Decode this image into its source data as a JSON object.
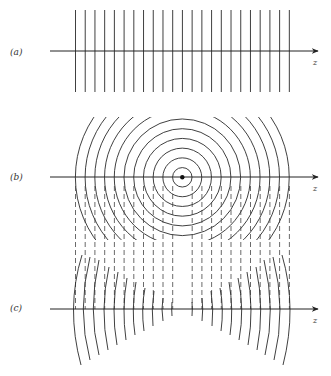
{
  "figure": {
    "width": 331,
    "height": 376,
    "ink_color": "#2a2a2a",
    "background": "#ffffff",
    "panels": [
      {
        "id": "a",
        "label": "(a)",
        "label_pos": [
          10,
          55
        ],
        "axis": {
          "y": 51,
          "x_start": 50,
          "x_end": 318,
          "label": "z",
          "label_pos": [
            313,
            65
          ]
        },
        "description": "plane wavefronts",
        "plane_wavefronts": {
          "x_start": 75.5,
          "spacing": 9.72,
          "count": 23,
          "y_top": 10,
          "y_bottom": 92
        }
      },
      {
        "id": "b",
        "label": "(b)",
        "label_pos": [
          10,
          180
        ],
        "axis": {
          "y": 177,
          "x_start": 50,
          "x_end": 318,
          "label": "z",
          "label_pos": [
            313,
            191
          ]
        },
        "description": "spherical wavefronts from point source",
        "point_source": {
          "cx": 182.3,
          "cy": 177.3,
          "r": 2.2
        },
        "spherical_wavefronts": {
          "radius_step": 9.72,
          "count": 11,
          "clip": {
            "x": 72,
            "y": 117,
            "w": 220,
            "h": 123
          }
        }
      },
      {
        "id": "c",
        "label": "(c)",
        "label_pos": [
          10,
          311
        ],
        "axis": {
          "y": 309,
          "x_start": 50,
          "x_end": 318,
          "label": "z",
          "label_pos": [
            313,
            323
          ]
        },
        "description": "superposition: dashed plane waves with curved wavefront segments",
        "dashed_lines": {
          "x_positions": [
            75.5,
            85.2,
            94.9,
            104.7,
            114.4,
            124.1,
            133.8,
            143.5,
            153.3,
            163.0,
            172.7,
            192.2,
            201.9,
            211.6,
            221.3,
            231.0,
            240.8,
            250.5,
            260.2,
            269.9,
            279.6,
            289.4
          ],
          "y_top": 186,
          "y_bottom": 309
        },
        "curved_segments_left": [
          {
            "axis_x": 73.5,
            "top": [
              82,
              255
            ],
            "bottom": [
              81,
              365
            ]
          },
          {
            "axis_x": 83.3,
            "top": [
              90,
              257
            ],
            "bottom": [
              90,
              360
            ]
          },
          {
            "axis_x": 93.3,
            "top": [
              99,
              260
            ],
            "bottom": [
              99,
              355
            ]
          },
          {
            "axis_x": 104.0,
            "top": [
              109,
              267
            ],
            "bottom": [
              108,
              350
            ]
          },
          {
            "axis_x": 114.0,
            "top": [
              118,
              272
            ],
            "bottom": [
              117,
              345
            ]
          },
          {
            "axis_x": 124.0,
            "top": [
              127,
              278
            ],
            "bottom": [
              126,
              340
            ]
          },
          {
            "axis_x": 133.3,
            "top": [
              136,
              282
            ],
            "bottom": [
              135,
              335
            ]
          },
          {
            "axis_x": 142.7,
            "top": [
              145,
              288
            ],
            "bottom": [
              144,
              331
            ]
          },
          {
            "axis_x": 152.3,
            "top": [
              154,
              291
            ],
            "bottom": [
              153,
              326
            ]
          },
          {
            "axis_x": 162.0,
            "top": [
              163,
              298
            ],
            "bottom": [
              163,
              321
            ]
          },
          {
            "axis_x": 171.7,
            "top": [
              172,
              302
            ],
            "bottom": [
              172,
              316
            ]
          }
        ],
        "curved_segments_right": [
          {
            "axis_x": 192.3,
            "top": [
              192,
              302
            ],
            "bottom": [
              192,
              316
            ]
          },
          {
            "axis_x": 202.7,
            "top": [
              202,
              298
            ],
            "bottom": [
              202,
              321
            ]
          },
          {
            "axis_x": 212.7,
            "top": [
              211,
              291
            ],
            "bottom": [
              212,
              326
            ]
          },
          {
            "axis_x": 222.3,
            "top": [
              220,
              288
            ],
            "bottom": [
              221,
              331
            ]
          },
          {
            "axis_x": 231.7,
            "top": [
              229,
              282
            ],
            "bottom": [
              230,
              335
            ]
          },
          {
            "axis_x": 241.7,
            "top": [
              238,
              278
            ],
            "bottom": [
              239,
              340
            ]
          },
          {
            "axis_x": 251.0,
            "top": [
              247,
              272
            ],
            "bottom": [
              248,
              345
            ]
          },
          {
            "axis_x": 260.7,
            "top": [
              256,
              267
            ],
            "bottom": [
              257,
              350
            ]
          },
          {
            "axis_x": 270.3,
            "top": [
              264,
              260
            ],
            "bottom": [
              265,
              355
            ]
          },
          {
            "axis_x": 280.0,
            "top": [
              273,
              257
            ],
            "bottom": [
              274,
              360
            ]
          },
          {
            "axis_x": 290.0,
            "top": [
              282,
              255
            ],
            "bottom": [
              283,
              365
            ]
          }
        ]
      }
    ]
  }
}
